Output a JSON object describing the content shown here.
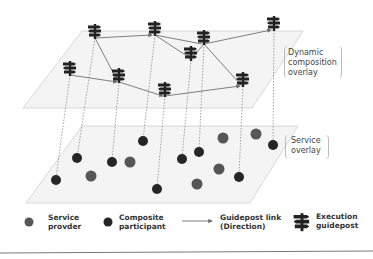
{
  "overlays": {
    "dynamic": {
      "label_lines": [
        "Dynamic",
        "composition",
        "overlay"
      ]
    },
    "service": {
      "label_lines": [
        "Service",
        "overlay"
      ]
    }
  },
  "legend": {
    "service_provider": {
      "lines": [
        "Service",
        "provder"
      ],
      "color": "#555555"
    },
    "composite_participant": {
      "lines": [
        "Composite",
        "participant"
      ],
      "color": "#2a2a2a"
    },
    "guidepost_link": {
      "lines": [
        "Guidepost link",
        "(Direction)"
      ],
      "color": "#666666"
    },
    "execution_guidepost": {
      "lines": [
        "Execution",
        "guidepost"
      ],
      "color": "#222222"
    }
  },
  "colors": {
    "plane_fill": "#f3f3f3",
    "plane_stroke": "#cccccc",
    "provider": "#555555",
    "participant": "#262626",
    "link": "#707070"
  }
}
